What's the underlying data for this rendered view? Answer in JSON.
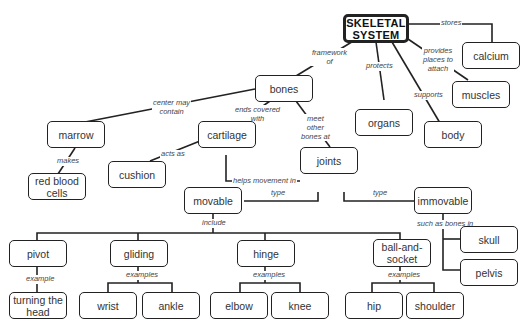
{
  "diagram": {
    "type": "concept-map",
    "root": "SKELETAL SYSTEM",
    "nodes": {
      "root": "SKELETAL\nSYSTEM",
      "calcium": "calcium",
      "muscles": "muscles",
      "body": "body",
      "organs": "organs",
      "bones": "bones",
      "marrow": "marrow",
      "red_blood_cells": "red blood cells",
      "cartilage": "cartilage",
      "cushion": "cushion",
      "joints": "joints",
      "movable": "movable",
      "immovable": "immovable",
      "skull": "skull",
      "pelvis": "pelvis",
      "pivot": "pivot",
      "turning_head": "turning the head",
      "gliding": "gliding",
      "wrist": "wrist",
      "ankle": "ankle",
      "hinge": "hinge",
      "elbow": "elbow",
      "knee": "knee",
      "ball_socket": "ball-and-socket",
      "hip": "hip",
      "shoulder": "shoulder"
    },
    "links": {
      "stores": "stores",
      "provides": "provides places to attach",
      "supports": "supports",
      "protects": "protects",
      "framework": "framework of",
      "center": "center may contain",
      "makes": "makes",
      "ends": "ends covered with",
      "acts": "acts as",
      "meet": "meet other bones at",
      "helps": "helps movement in",
      "type1": "type",
      "type2": "type",
      "include": "include",
      "such_as": "such as bones in",
      "example": "example",
      "examples1": "examples",
      "examples2": "examples",
      "examples3": "examples"
    },
    "edges": [
      {
        "from": "SKELETAL SYSTEM",
        "label": "stores",
        "to": "calcium"
      },
      {
        "from": "SKELETAL SYSTEM",
        "label": "provides places to attach",
        "to": "muscles"
      },
      {
        "from": "SKELETAL SYSTEM",
        "label": "supports",
        "to": "body"
      },
      {
        "from": "SKELETAL SYSTEM",
        "label": "protects",
        "to": "organs"
      },
      {
        "from": "SKELETAL SYSTEM",
        "label": "framework of",
        "to": "bones"
      },
      {
        "from": "bones",
        "label": "center may contain",
        "to": "marrow"
      },
      {
        "from": "marrow",
        "label": "makes",
        "to": "red blood cells"
      },
      {
        "from": "bones",
        "label": "ends covered with",
        "to": "cartilage"
      },
      {
        "from": "cartilage",
        "label": "acts as",
        "to": "cushion"
      },
      {
        "from": "bones",
        "label": "meet other bones at",
        "to": "joints"
      },
      {
        "from": "cartilage",
        "label": "helps movement in",
        "to": "joints"
      },
      {
        "from": "joints",
        "label": "type",
        "to": "movable"
      },
      {
        "from": "joints",
        "label": "type",
        "to": "immovable"
      },
      {
        "from": "immovable",
        "label": "such as bones in",
        "to": "skull"
      },
      {
        "from": "immovable",
        "label": "such as bones in",
        "to": "pelvis"
      },
      {
        "from": "movable",
        "label": "include",
        "to": "pivot"
      },
      {
        "from": "movable",
        "label": "include",
        "to": "gliding"
      },
      {
        "from": "movable",
        "label": "include",
        "to": "hinge"
      },
      {
        "from": "movable",
        "label": "include",
        "to": "ball-and-socket"
      },
      {
        "from": "pivot",
        "label": "example",
        "to": "turning the head"
      },
      {
        "from": "gliding",
        "label": "examples",
        "to": "wrist"
      },
      {
        "from": "gliding",
        "label": "examples",
        "to": "ankle"
      },
      {
        "from": "hinge",
        "label": "examples",
        "to": "elbow"
      },
      {
        "from": "hinge",
        "label": "examples",
        "to": "knee"
      },
      {
        "from": "ball-and-socket",
        "label": "examples",
        "to": "hip"
      },
      {
        "from": "ball-and-socket",
        "label": "examples",
        "to": "shoulder"
      }
    ]
  }
}
